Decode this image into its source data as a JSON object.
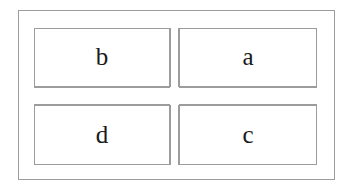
{
  "figure": {
    "name": "two-by-two-labeled-grid",
    "cells": {
      "top_left": "b",
      "top_right": "a",
      "bottom_left": "d",
      "bottom_right": "c"
    },
    "colors": {
      "line": "#9c9c9c",
      "text": "#1a1a1a",
      "background": "#ffffff"
    }
  }
}
